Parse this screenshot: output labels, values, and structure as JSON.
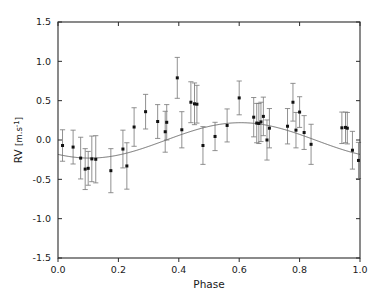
{
  "figure": {
    "width": 381,
    "height": 296,
    "background": "#ffffff"
  },
  "chart_data": {
    "type": "scatter",
    "title": "",
    "xlabel": "Phase",
    "ylabel": "RV",
    "ylabel_unit": "[m.s",
    "ylabel_unit_exp": "-1",
    "ylabel_unit_close": "]",
    "ylabel_full": "RV [m.s^-1]",
    "xlim": [
      0.0,
      1.0
    ],
    "ylim": [
      -1.5,
      1.5
    ],
    "xticks": [
      0.0,
      0.2,
      0.4,
      0.6,
      0.8,
      1.0
    ],
    "xticklabels": [
      "0.0",
      "0.2",
      "0.4",
      "0.6",
      "0.8",
      "1.0"
    ],
    "yticks": [
      -1.5,
      -1.0,
      -0.5,
      0.0,
      0.5,
      1.0,
      1.5
    ],
    "yticklabels": [
      "-1.5",
      "-1.0",
      "-0.5",
      "0.0",
      "0.5",
      "1.0",
      "1.5"
    ],
    "grid": false,
    "legend": null,
    "marker_color": "#111111",
    "errorbar_color": "#7d7d7d",
    "curve_color": "#6e6e6e",
    "series": [
      {
        "name": "Radial velocity measurements",
        "marker": "square",
        "x": [
          0.015,
          0.05,
          0.075,
          0.09,
          0.1,
          0.112,
          0.125,
          0.175,
          0.215,
          0.228,
          0.252,
          0.29,
          0.33,
          0.355,
          0.36,
          0.395,
          0.41,
          0.44,
          0.452,
          0.46,
          0.48,
          0.52,
          0.56,
          0.6,
          0.648,
          0.658,
          0.665,
          0.672,
          0.68,
          0.692,
          0.7,
          0.76,
          0.778,
          0.788,
          0.8,
          0.815,
          0.838,
          0.94,
          0.952,
          0.958,
          0.975,
          0.995
        ],
        "y": [
          -0.07,
          -0.09,
          -0.23,
          -0.37,
          -0.36,
          -0.24,
          -0.245,
          -0.39,
          -0.115,
          -0.33,
          0.165,
          0.36,
          0.235,
          0.105,
          0.225,
          0.79,
          0.13,
          0.48,
          0.46,
          0.455,
          -0.07,
          0.045,
          0.185,
          0.535,
          0.29,
          0.215,
          0.21,
          0.23,
          0.3,
          0.0,
          0.15,
          0.175,
          0.48,
          0.125,
          0.355,
          0.095,
          -0.055,
          0.155,
          0.16,
          0.15,
          -0.13,
          -0.26
        ],
        "yerr": [
          0.2,
          0.215,
          0.265,
          0.26,
          0.215,
          0.29,
          0.3,
          0.28,
          0.24,
          0.295,
          0.245,
          0.22,
          0.215,
          0.26,
          0.225,
          0.26,
          0.23,
          0.26,
          0.265,
          0.24,
          0.24,
          0.18,
          0.21,
          0.215,
          0.25,
          0.25,
          0.255,
          0.25,
          0.245,
          0.255,
          0.25,
          0.225,
          0.24,
          0.225,
          0.195,
          0.215,
          0.255,
          0.2,
          0.195,
          0.2,
          0.24,
          0.23
        ]
      }
    ],
    "model": {
      "name": "Keplerian / sinusoidal fit",
      "type": "sine",
      "amplitude": 0.225,
      "offset": -0.005,
      "phase_of_maximum": 0.605,
      "minimum_value": -0.23,
      "maximum_value": 0.22
    }
  }
}
